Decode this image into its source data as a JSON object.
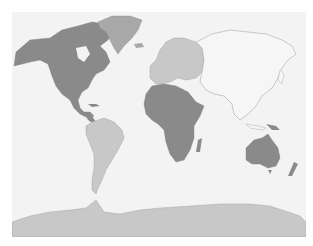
{
  "map": {
    "type": "world-choropleth",
    "colors": {
      "background": "#ffffff",
      "ocean": "#f3f3f3",
      "border": "#8a8a8a",
      "dark": "#8a8a8a",
      "medium": "#a8a8a8",
      "light": "#c8c8c8",
      "none": "#f6f6f6"
    },
    "regions": [
      {
        "name": "North America",
        "shade": "dark"
      },
      {
        "name": "Greenland",
        "shade": "medium"
      },
      {
        "name": "South America",
        "shade": "light"
      },
      {
        "name": "Europe",
        "shade": "light"
      },
      {
        "name": "Africa",
        "shade": "dark"
      },
      {
        "name": "Asia",
        "shade": "none"
      },
      {
        "name": "Australia",
        "shade": "dark"
      },
      {
        "name": "New Zealand",
        "shade": "dark"
      },
      {
        "name": "Papua New Guinea",
        "shade": "dark"
      },
      {
        "name": "Antarctica",
        "shade": "light"
      }
    ]
  }
}
